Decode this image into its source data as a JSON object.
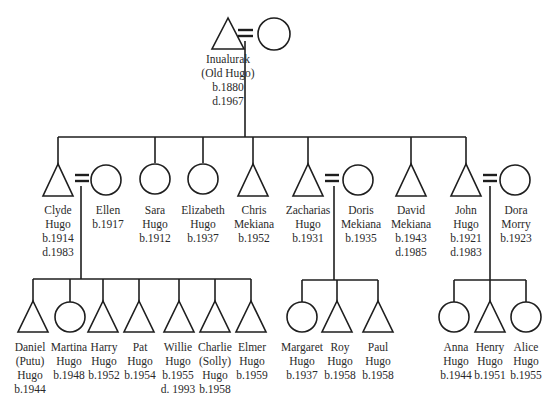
{
  "diagram": {
    "type": "kinship-chart",
    "legend_symbols": {
      "male": "triangle",
      "female": "circle",
      "marriage": "="
    },
    "generation_1": [
      {
        "id": "inualurak",
        "sex": "male",
        "x": 228,
        "lines": [
          "Inualurak",
          "(Old Hugo)",
          "b.1880",
          "d.1967"
        ]
      },
      {
        "id": "wife-inualurak",
        "sex": "female",
        "x": 273,
        "lines": []
      }
    ],
    "generation_2": [
      {
        "id": "clyde",
        "sex": "male",
        "x": 58,
        "lines": [
          "Clyde",
          "Hugo",
          "b.1914",
          "d.1983"
        ]
      },
      {
        "id": "ellen",
        "sex": "female",
        "x": 106,
        "lines": [
          "Ellen",
          "b.1917"
        ]
      },
      {
        "id": "sara",
        "sex": "female",
        "x": 155,
        "lines": [
          "Sara",
          "Hugo",
          "b.1912"
        ]
      },
      {
        "id": "elizabeth",
        "sex": "female",
        "x": 203,
        "lines": [
          "Elizabeth",
          "Hugo",
          "b.1937"
        ]
      },
      {
        "id": "chris",
        "sex": "male",
        "x": 253,
        "lines": [
          "Chris",
          "Mekiana",
          "b.1952"
        ]
      },
      {
        "id": "zacharias",
        "sex": "male",
        "x": 308,
        "lines": [
          "Zacharias",
          "Hugo",
          "b.1931"
        ]
      },
      {
        "id": "doris",
        "sex": "female",
        "x": 361,
        "lines": [
          "Doris",
          "Mekiana",
          "b.1935"
        ]
      },
      {
        "id": "david",
        "sex": "male",
        "x": 411,
        "lines": [
          "David",
          "Mekiana",
          "b.1943",
          "d.1985"
        ]
      },
      {
        "id": "john",
        "sex": "male",
        "x": 466,
        "lines": [
          "John",
          "Hugo",
          "b.1921",
          "d.1983"
        ]
      },
      {
        "id": "dora",
        "sex": "female",
        "x": 515,
        "lines": [
          "Dora",
          "Morry",
          "b.1923"
        ]
      }
    ],
    "generation_3": [
      {
        "id": "daniel",
        "sex": "male",
        "x": 33,
        "lines": [
          "Daniel",
          "(Putu)",
          "Hugo",
          "b.1944"
        ]
      },
      {
        "id": "martina",
        "sex": "female",
        "x": 70,
        "lines": [
          "Martina",
          "Hugo",
          "b.1948"
        ]
      },
      {
        "id": "harry",
        "sex": "male",
        "x": 103,
        "lines": [
          "Harry",
          "Hugo",
          "b.1952"
        ]
      },
      {
        "id": "pat",
        "sex": "male",
        "x": 139,
        "lines": [
          "Pat",
          "Hugo",
          "b.1954"
        ]
      },
      {
        "id": "willie",
        "sex": "male",
        "x": 179,
        "lines": [
          "Willie",
          "Hugo",
          "b.1955",
          "d. 1993"
        ]
      },
      {
        "id": "charlie",
        "sex": "male",
        "x": 215,
        "lines": [
          "Charlie",
          "(Solly)",
          "Hugo",
          "b.1958"
        ]
      },
      {
        "id": "elmer",
        "sex": "male",
        "x": 251,
        "lines": [
          "Elmer",
          "Hugo",
          "b.1959"
        ]
      },
      {
        "id": "margaret",
        "sex": "female",
        "x": 302,
        "lines": [
          "Margaret",
          "Hugo",
          "b.1937"
        ]
      },
      {
        "id": "roy",
        "sex": "male",
        "x": 337,
        "lines": [
          "Roy",
          "Hugo",
          "b.1958"
        ]
      },
      {
        "id": "paul",
        "sex": "male",
        "x": 378,
        "lines": [
          "Paul",
          "Hugo",
          "b.1958"
        ]
      },
      {
        "id": "anna",
        "sex": "female",
        "x": 454,
        "lines": [
          "Anna",
          "Hugo",
          "b.1944"
        ]
      },
      {
        "id": "henry",
        "sex": "male",
        "x": 490,
        "lines": [
          "Henry",
          "Hugo",
          "b.1951"
        ]
      },
      {
        "id": "alice",
        "sex": "female",
        "x": 526,
        "lines": [
          "Alice",
          "Hugo",
          "b.1955"
        ]
      }
    ],
    "marriages": [
      {
        "husband": "inualurak",
        "wife": "wife-inualurak"
      },
      {
        "husband": "clyde",
        "wife": "ellen",
        "children": [
          "daniel",
          "martina",
          "harry",
          "pat",
          "willie",
          "charlie",
          "elmer"
        ]
      },
      {
        "husband": "zacharias",
        "wife": "doris",
        "children": [
          "margaret",
          "roy",
          "paul"
        ]
      },
      {
        "husband": "john",
        "wife": "dora",
        "children": [
          "anna",
          "henry",
          "alice"
        ]
      }
    ]
  }
}
